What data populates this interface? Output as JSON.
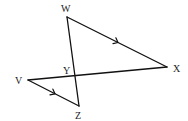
{
  "diagram": {
    "type": "geometry",
    "points": {
      "W": {
        "label": "W",
        "x": 67,
        "y": 17,
        "label_x": 61,
        "label_y": 12
      },
      "X": {
        "label": "X",
        "x": 167,
        "y": 67,
        "label_x": 173,
        "label_y": 72
      },
      "V": {
        "label": "V",
        "x": 28,
        "y": 80,
        "label_x": 15,
        "label_y": 84
      },
      "Z": {
        "label": "Z",
        "x": 79,
        "y": 106,
        "label_x": 75,
        "label_y": 119
      },
      "Y": {
        "label": "Y",
        "x": 75,
        "y": 77,
        "label_x": 63,
        "label_y": 74
      }
    },
    "segments": [
      {
        "from": "W",
        "to": "X",
        "parallel_arrow": true
      },
      {
        "from": "V",
        "to": "Z",
        "parallel_arrow": true
      },
      {
        "from": "W",
        "to": "Z",
        "parallel_arrow": false
      },
      {
        "from": "V",
        "to": "X",
        "parallel_arrow": false
      }
    ],
    "annotations": "WX is parallel to VZ; segments WZ and VX intersect at Y",
    "colors": {
      "stroke": "#111111",
      "label": "#222222",
      "background": "#ffffff"
    }
  }
}
